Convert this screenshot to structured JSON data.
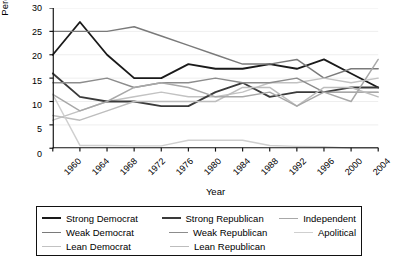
{
  "chart_data": {
    "type": "line",
    "title": "",
    "xlabel": "Year",
    "ylabel": "Percentage",
    "x": [
      1960,
      1964,
      1968,
      1972,
      1976,
      1980,
      1984,
      1988,
      1992,
      1996,
      2000,
      2004,
      2008
    ],
    "xtick_labels": [
      "1960",
      "1964",
      "1968",
      "1972",
      "1976",
      "1980",
      "1984",
      "1988",
      "1992",
      "1996",
      "2000",
      "2004",
      "2008"
    ],
    "ytick_labels": [
      "0",
      "5",
      "10",
      "15",
      "20",
      "25",
      "30"
    ],
    "yticks": [
      0,
      5,
      10,
      15,
      20,
      25,
      30
    ],
    "ylim": [
      0,
      30
    ],
    "xlim": [
      1960,
      2008
    ],
    "grid": true,
    "legend_position": "below-plot",
    "series": [
      {
        "name": "Strong Democrat",
        "color": "#1a1a1a",
        "width": 1.9,
        "values": [
          20,
          27,
          20,
          15,
          15,
          18,
          17,
          17,
          18,
          17,
          19,
          16,
          13
        ]
      },
      {
        "name": "Weak Democrat",
        "color": "#7a7a7a",
        "width": 1.5,
        "values": [
          25,
          25,
          25,
          26,
          24,
          22,
          20,
          18,
          18,
          19,
          15,
          17,
          17
        ]
      },
      {
        "name": "Lean Democrat",
        "color": "#c2c2c2",
        "width": 1.5,
        "values": [
          6,
          8,
          10,
          11,
          12,
          11,
          11,
          12,
          14,
          14,
          15,
          14,
          15
        ]
      },
      {
        "name": "Strong Republican",
        "color": "#3a3a3a",
        "width": 1.9,
        "values": [
          16,
          11,
          10,
          10,
          9,
          9,
          12,
          14,
          11,
          12,
          12,
          13,
          13
        ]
      },
      {
        "name": "Weak Republican",
        "color": "#8c8c8c",
        "width": 1.5,
        "values": [
          14,
          14,
          15,
          13,
          14,
          14,
          15,
          14,
          14,
          15,
          12,
          12,
          12
        ]
      },
      {
        "name": "Lean Republican",
        "color": "#bdbdbd",
        "width": 1.5,
        "values": [
          7,
          6,
          8,
          10,
          10,
          10,
          10,
          13,
          13,
          9,
          13,
          13,
          11
        ]
      },
      {
        "name": "Independent",
        "color": "#a8a8a8",
        "width": 1.5,
        "values": [
          11.5,
          8,
          10,
          13,
          14,
          13,
          11,
          11,
          12,
          9,
          12,
          10,
          19
        ]
      },
      {
        "name": "Apolitical",
        "color": "#cfcfcf",
        "width": 1.5,
        "values": [
          11.5,
          0.6,
          0.6,
          0.5,
          0.5,
          1.7,
          1.7,
          1.7,
          0.6,
          0.4,
          0.3,
          0,
          0
        ]
      }
    ]
  },
  "legend": {
    "columns": [
      [
        {
          "label": "Strong Democrat",
          "color": "#1a1a1a",
          "width": 2.2
        },
        {
          "label": "Weak Democrat",
          "color": "#7a7a7a",
          "width": 1.8
        },
        {
          "label": "Lean Democrat",
          "color": "#c2c2c2",
          "width": 1.8
        }
      ],
      [
        {
          "label": "Strong Republican",
          "color": "#3a3a3a",
          "width": 2.2
        },
        {
          "label": "Weak Republican",
          "color": "#8c8c8c",
          "width": 1.8
        },
        {
          "label": "Lean Republican",
          "color": "#bdbdbd",
          "width": 1.8
        }
      ],
      [
        {
          "label": "Independent",
          "color": "#a8a8a8",
          "width": 1.8
        },
        {
          "label": "Apolitical",
          "color": "#cfcfcf",
          "width": 1.8
        }
      ]
    ]
  },
  "axis_style": {
    "axis_color": "#111111",
    "grid_color": "#ededed",
    "background": "#ffffff"
  }
}
